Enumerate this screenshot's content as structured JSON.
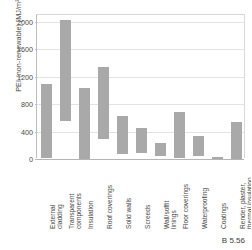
{
  "caption": "B 5.56",
  "chart_data": {
    "type": "bar",
    "bar_style": "floating-range",
    "title": "",
    "xlabel": "",
    "ylabel": "PEI (non-renewable) [MJ/m²]",
    "ylim": [
      0,
      2100
    ],
    "yticks": [
      0,
      400,
      800,
      1200,
      1600,
      2000
    ],
    "ytick_labels": [
      "0",
      "400",
      "800",
      "1200",
      "1600",
      "2000"
    ],
    "grid": true,
    "legend": "none",
    "categories": [
      "External cladding",
      "Transparent components",
      "Insulation",
      "Roof coverings",
      "Solid walls",
      "Screeds",
      "Wall/soffit linings",
      "Floor coverings",
      "Waterproofing",
      "Coatings",
      "Render, plaster, thermal insulation"
    ],
    "low_values": [
      20,
      560,
      0,
      290,
      80,
      85,
      50,
      10,
      50,
      0,
      0
    ],
    "high_values": [
      1090,
      2030,
      1040,
      1340,
      630,
      450,
      230,
      690,
      340,
      25,
      540
    ]
  }
}
